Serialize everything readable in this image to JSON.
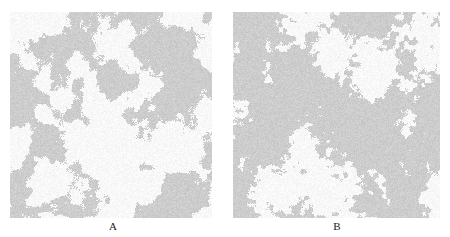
{
  "figure": {
    "panels": [
      {
        "id": "A",
        "label": "A",
        "description": "Sparser gray cluster texture with large white regions"
      },
      {
        "id": "B",
        "label": "B",
        "description": "Denser gray cluster texture with finer white speckles"
      }
    ]
  }
}
